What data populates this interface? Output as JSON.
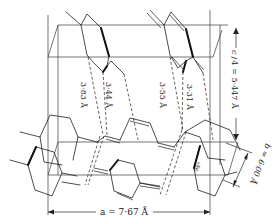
{
  "diagram": {
    "type": "crystal-structure-projection",
    "distances": [
      {
        "label": "3·83 Å"
      },
      {
        "label": "3·44 Å"
      },
      {
        "label": "3·55 Å"
      },
      {
        "label": "3·31 Å"
      }
    ],
    "axes": {
      "a": {
        "label": "a = 7·67 Å"
      },
      "b": {
        "label": "b = 6·00 Å"
      },
      "c": {
        "label": "c/4 = 5·447 Å",
        "fraction_num": "c",
        "fraction_den": "4",
        "value": "= 5·447 Å"
      }
    },
    "angle": {
      "label": "98°"
    }
  }
}
